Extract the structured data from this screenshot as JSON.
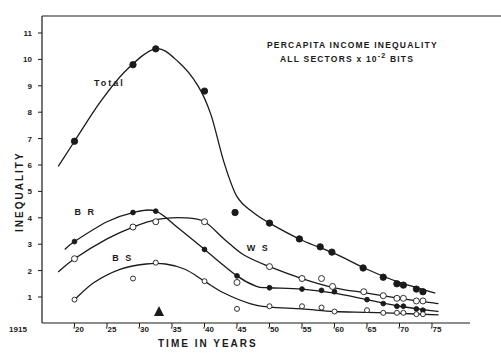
{
  "chart_data": {
    "type": "line",
    "subtitle": "ALL SECTORS x 10^-2 BITS",
    "title_line1": "PERCAPITA  INCOME  INEQUALITY",
    "title_line2_prefix": "ALL  SECTORS  x  10",
    "title_line2_exp": "-2",
    "title_line2_suffix": " BITS",
    "xlabel": "TIME  IN  YEARS",
    "ylabel": "INEQUALITY",
    "xlim": [
      1915,
      1977
    ],
    "ylim": [
      0,
      11.5
    ],
    "grid": false,
    "legend": "inline labels",
    "x_ticks": [
      {
        "value": 1915,
        "label": "1915"
      },
      {
        "value": 1920,
        "label": "'20"
      },
      {
        "value": 1925,
        "label": "'25"
      },
      {
        "value": 1930,
        "label": "'30"
      },
      {
        "value": 1935,
        "label": "'35"
      },
      {
        "value": 1940,
        "label": "'40"
      },
      {
        "value": 1945,
        "label": "'45"
      },
      {
        "value": 1950,
        "label": "'50"
      },
      {
        "value": 1955,
        "label": "'55"
      },
      {
        "value": 1960,
        "label": "'60"
      },
      {
        "value": 1965,
        "label": "'65"
      },
      {
        "value": 1970,
        "label": "'70"
      },
      {
        "value": 1975,
        "label": "'75"
      }
    ],
    "y_ticks": [
      1,
      2,
      3,
      4,
      5,
      6,
      7,
      8,
      9,
      10,
      11
    ],
    "annotation": {
      "type": "triangle-marker",
      "x": 1933
    },
    "series": [
      {
        "name": "Total",
        "marker": "filled-large",
        "label_pos": [
          1923,
          9.0
        ],
        "points": [
          [
            1920,
            6.9
          ],
          [
            1929,
            9.8
          ],
          [
            1932.5,
            10.4
          ],
          [
            1940,
            8.8
          ],
          [
            1944.7,
            4.2
          ],
          [
            1950,
            3.8
          ],
          [
            1954.6,
            3.2
          ],
          [
            1957.8,
            2.9
          ],
          [
            1959.6,
            2.7
          ],
          [
            1964.4,
            2.1
          ],
          [
            1967.5,
            1.75
          ],
          [
            1969.6,
            1.5
          ],
          [
            1970.6,
            1.45
          ],
          [
            1972.6,
            1.3
          ],
          [
            1973.6,
            1.2
          ]
        ],
        "curve": [
          [
            1917.5,
            5.95
          ],
          [
            1920,
            6.9
          ],
          [
            1924,
            8.4
          ],
          [
            1928,
            9.6
          ],
          [
            1932.5,
            10.4
          ],
          [
            1936,
            9.9
          ],
          [
            1939,
            9.0
          ],
          [
            1941,
            7.9
          ],
          [
            1943,
            6.1
          ],
          [
            1945,
            4.8
          ],
          [
            1947.5,
            4.2
          ],
          [
            1950,
            3.8
          ],
          [
            1955,
            3.15
          ],
          [
            1960,
            2.65
          ],
          [
            1965,
            2.05
          ],
          [
            1970,
            1.55
          ],
          [
            1975.5,
            1.15
          ]
        ]
      },
      {
        "name": "BR",
        "marker": "filled-small",
        "label_pos": [
          1920,
          4.1
        ],
        "points": [
          [
            1920,
            3.1
          ],
          [
            1929,
            4.2
          ],
          [
            1932.5,
            4.25
          ],
          [
            1940,
            2.8
          ],
          [
            1945,
            1.8
          ],
          [
            1950,
            1.35
          ],
          [
            1955,
            1.3
          ],
          [
            1958,
            1.25
          ],
          [
            1960,
            1.2
          ],
          [
            1965,
            0.9
          ],
          [
            1967.5,
            0.75
          ],
          [
            1969.6,
            0.65
          ],
          [
            1970.6,
            0.65
          ],
          [
            1972.6,
            0.55
          ],
          [
            1973.6,
            0.5
          ]
        ],
        "curve": [
          [
            1918.5,
            2.8
          ],
          [
            1920,
            3.1
          ],
          [
            1925,
            3.85
          ],
          [
            1929,
            4.2
          ],
          [
            1932.5,
            4.25
          ],
          [
            1936,
            3.6
          ],
          [
            1940,
            2.8
          ],
          [
            1945,
            1.8
          ],
          [
            1948,
            1.4
          ],
          [
            1950,
            1.35
          ],
          [
            1955,
            1.3
          ],
          [
            1960,
            1.15
          ],
          [
            1965,
            0.9
          ],
          [
            1970,
            0.65
          ],
          [
            1976,
            0.45
          ]
        ]
      },
      {
        "name": "WS",
        "marker": "open",
        "label_pos": [
          1946.5,
          2.75
        ],
        "points": [
          [
            1920,
            2.45
          ],
          [
            1929,
            3.65
          ],
          [
            1932.5,
            3.85
          ],
          [
            1940,
            3.85
          ],
          [
            1945,
            1.55
          ],
          [
            1950,
            2.15
          ],
          [
            1955,
            1.7
          ],
          [
            1958,
            1.7
          ],
          [
            1959.7,
            1.4
          ],
          [
            1964.5,
            1.2
          ],
          [
            1967.5,
            1.05
          ],
          [
            1969.6,
            0.95
          ],
          [
            1970.6,
            0.95
          ],
          [
            1972.6,
            0.85
          ],
          [
            1973.6,
            0.85
          ]
        ],
        "curve": [
          [
            1917.5,
            1.95
          ],
          [
            1920,
            2.45
          ],
          [
            1925,
            3.2
          ],
          [
            1929,
            3.65
          ],
          [
            1933,
            3.95
          ],
          [
            1937,
            4.0
          ],
          [
            1940,
            3.85
          ],
          [
            1943,
            3.2
          ],
          [
            1946,
            2.6
          ],
          [
            1950,
            2.15
          ],
          [
            1955,
            1.7
          ],
          [
            1960,
            1.35
          ],
          [
            1965,
            1.15
          ],
          [
            1970,
            0.95
          ],
          [
            1976,
            0.75
          ]
        ]
      },
      {
        "name": "BS",
        "marker": "open-small",
        "label_pos": [
          1925.8,
          2.35
        ],
        "points": [
          [
            1920,
            0.9
          ],
          [
            1929,
            1.7
          ],
          [
            1932.5,
            2.3
          ],
          [
            1940,
            1.6
          ],
          [
            1945,
            0.55
          ],
          [
            1950,
            0.65
          ],
          [
            1955,
            0.65
          ],
          [
            1958,
            0.6
          ],
          [
            1960,
            0.45
          ],
          [
            1965,
            0.5
          ],
          [
            1967.5,
            0.4
          ],
          [
            1969.6,
            0.4
          ],
          [
            1970.6,
            0.4
          ],
          [
            1972.6,
            0.35
          ],
          [
            1973.6,
            0.35
          ]
        ],
        "curve": [
          [
            1920,
            0.9
          ],
          [
            1923,
            1.55
          ],
          [
            1927,
            2.05
          ],
          [
            1931,
            2.25
          ],
          [
            1934,
            2.25
          ],
          [
            1937,
            2.05
          ],
          [
            1940,
            1.6
          ],
          [
            1943,
            1.15
          ],
          [
            1947,
            0.75
          ],
          [
            1950,
            0.62
          ],
          [
            1955,
            0.55
          ],
          [
            1960,
            0.45
          ],
          [
            1965,
            0.42
          ],
          [
            1970,
            0.38
          ],
          [
            1976,
            0.32
          ]
        ]
      }
    ]
  },
  "colors": {
    "ink": "#1a1a1a",
    "background": "#ffffff"
  }
}
